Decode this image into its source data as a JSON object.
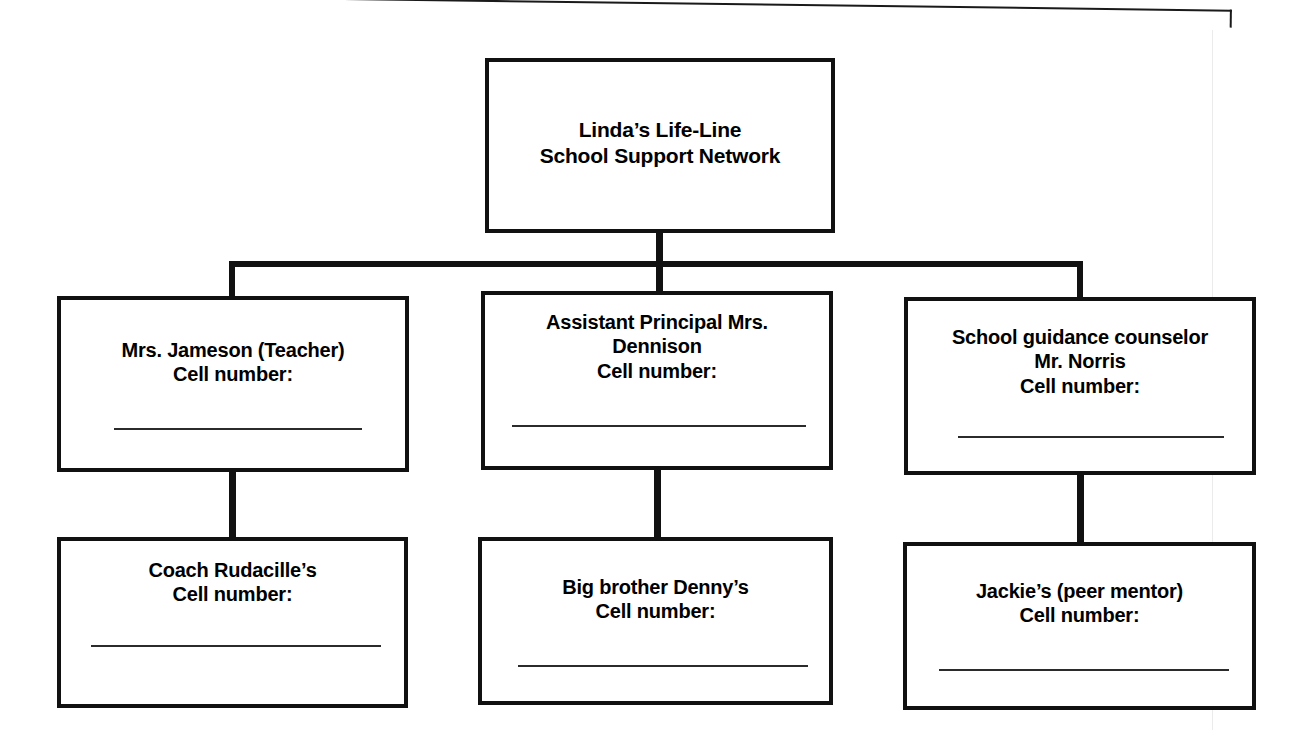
{
  "document": {
    "type": "organizational-chart",
    "title": "Linda's Life-Line School Support Network"
  },
  "chart": {
    "root": {
      "id": "root",
      "label": "Linda’s Life-Line\nSchool Support Network",
      "has_fill_line": false
    },
    "tier_two": [
      {
        "id": "teacher",
        "label": "Mrs. Jameson (Teacher)\nCell number:",
        "has_fill_line": true
      },
      {
        "id": "assistant-principal",
        "label": "Assistant Principal Mrs.\nDennison\nCell number:",
        "has_fill_line": true
      },
      {
        "id": "guidance-counselor",
        "label": "School guidance counselor\nMr. Norris\nCell number:",
        "has_fill_line": true
      }
    ],
    "tier_three": [
      {
        "id": "coach",
        "label": "Coach Rudacille’s\nCell number:",
        "has_fill_line": true
      },
      {
        "id": "big-brother",
        "label": "Big brother Denny’s\nCell number:",
        "has_fill_line": true
      },
      {
        "id": "peer-mentor",
        "label": "Jackie’s (peer mentor)\nCell number:",
        "has_fill_line": true
      }
    ]
  },
  "colors": {
    "ink": "#111111",
    "rule": "#2b2b2b",
    "paper": "#ffffff"
  }
}
